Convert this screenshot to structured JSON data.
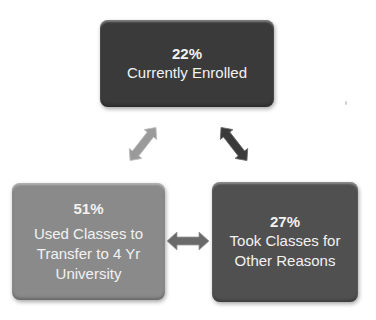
{
  "diagram": {
    "type": "cycle",
    "nodes": [
      {
        "id": "top",
        "percent": "22%",
        "label": "Currently Enrolled",
        "color": "#3a3a3a"
      },
      {
        "id": "left",
        "percent": "51%",
        "label": "Used Classes to Transfer to 4 Yr University",
        "color": "#8a8a8a"
      },
      {
        "id": "right",
        "percent": "27%",
        "label": "Took Classes for Other Reasons",
        "color": "#505050"
      }
    ],
    "arrows": [
      {
        "from": "left",
        "to": "top",
        "style": "double-headed",
        "color": "#9a9a9a"
      },
      {
        "from": "top",
        "to": "right",
        "style": "double-headed",
        "color": "#3a3a3a"
      },
      {
        "from": "left",
        "to": "right",
        "style": "double-headed",
        "color": "#6a6a6a"
      }
    ]
  }
}
